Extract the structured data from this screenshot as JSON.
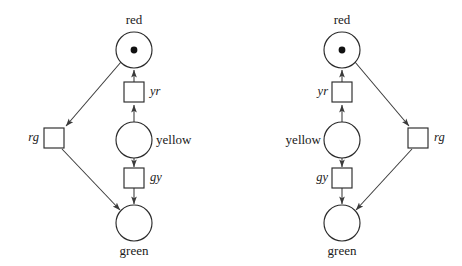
{
  "figure": {
    "type": "petri-net-pair",
    "background_color": "#ffffff",
    "stroke_color": "#2b2b2b",
    "arc_color": "#3a3a3a",
    "token_color": "#111111"
  },
  "diagrams": [
    {
      "id": "left",
      "variant": "rg-transition-on-left",
      "places": [
        {
          "name": "red",
          "label": "red",
          "tokens": 1,
          "cx": 134,
          "cy": 50,
          "r": 18,
          "label_x": 134,
          "label_y": 13,
          "label_align": "center"
        },
        {
          "name": "yellow",
          "label": "yellow",
          "tokens": 0,
          "cx": 134,
          "cy": 140,
          "r": 18,
          "label_x": 156,
          "label_y": 133,
          "label_align": "left"
        },
        {
          "name": "green",
          "label": "green",
          "tokens": 0,
          "cx": 134,
          "cy": 223,
          "r": 18,
          "label_x": 134,
          "label_y": 244,
          "label_align": "center"
        }
      ],
      "transitions": [
        {
          "name": "yr",
          "label": "yr",
          "x": 124,
          "y": 82,
          "w": 20,
          "h": 20,
          "label_x": 150,
          "label_y": 85,
          "label_align": "left"
        },
        {
          "name": "gy",
          "label": "gy",
          "x": 124,
          "y": 168,
          "w": 20,
          "h": 20,
          "label_x": 150,
          "label_y": 171,
          "label_align": "left"
        },
        {
          "name": "rg",
          "label": "rg",
          "x": 44,
          "y": 128,
          "w": 20,
          "h": 20,
          "label_x": 38,
          "label_y": 131,
          "label_align": "right"
        }
      ],
      "arcs": [
        {
          "from": "yellow",
          "to": "yr",
          "points": "134,122 134,104"
        },
        {
          "from": "yr",
          "to": "red",
          "points": "134,80 134,70"
        },
        {
          "from": "yellow",
          "to": "gy",
          "points": "134,158 134,166"
        },
        {
          "from": "gy",
          "to": "green",
          "points": "134,190 134,203"
        },
        {
          "from": "red",
          "to": "rg",
          "points": "121,63 66,126"
        },
        {
          "from": "rg",
          "to": "green",
          "points": "63,149 121,210"
        }
      ]
    },
    {
      "id": "right",
      "variant": "rg-transition-on-right",
      "places": [
        {
          "name": "red",
          "label": "red",
          "tokens": 1,
          "cx": 342,
          "cy": 50,
          "r": 18,
          "label_x": 342,
          "label_y": 13,
          "label_align": "center"
        },
        {
          "name": "yellow",
          "label": "yellow",
          "tokens": 0,
          "cx": 342,
          "cy": 140,
          "r": 18,
          "label_x": 320,
          "label_y": 133,
          "label_align": "right"
        },
        {
          "name": "green",
          "label": "green",
          "tokens": 0,
          "cx": 342,
          "cy": 223,
          "r": 18,
          "label_x": 342,
          "label_y": 244,
          "label_align": "center"
        }
      ],
      "transitions": [
        {
          "name": "yr",
          "label": "yr",
          "x": 332,
          "y": 82,
          "w": 20,
          "h": 20,
          "label_x": 327,
          "label_y": 85,
          "label_align": "right"
        },
        {
          "name": "gy",
          "label": "gy",
          "x": 332,
          "y": 168,
          "w": 20,
          "h": 20,
          "label_x": 327,
          "label_y": 171,
          "label_align": "right"
        },
        {
          "name": "rg",
          "label": "rg",
          "x": 408,
          "y": 128,
          "w": 20,
          "h": 20,
          "label_x": 434,
          "label_y": 131,
          "label_align": "left"
        }
      ],
      "arcs": [
        {
          "from": "yellow",
          "to": "yr",
          "points": "342,122 342,104"
        },
        {
          "from": "yr",
          "to": "red",
          "points": "342,80 342,70"
        },
        {
          "from": "yellow",
          "to": "gy",
          "points": "342,158 342,166"
        },
        {
          "from": "gy",
          "to": "green",
          "points": "342,190 342,203"
        },
        {
          "from": "red",
          "to": "rg",
          "points": "355,63 406,126"
        },
        {
          "from": "rg",
          "to": "green",
          "points": "409,149 355,210"
        }
      ]
    }
  ],
  "labels": {
    "left": {
      "red": "red",
      "yellow": "yellow",
      "green": "green",
      "yr": "yr",
      "gy": "gy",
      "rg": "rg"
    },
    "right": {
      "red": "red",
      "yellow": "yellow",
      "green": "green",
      "yr": "yr",
      "gy": "gy",
      "rg": "rg"
    }
  }
}
